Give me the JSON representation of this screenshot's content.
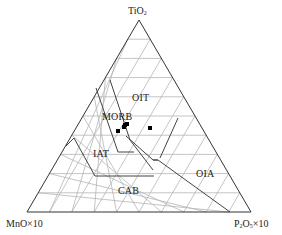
{
  "diagram": {
    "type": "ternary",
    "vertices": {
      "top": {
        "label": "TiO",
        "sub": "2"
      },
      "left": {
        "label": "MnO×10"
      },
      "right": {
        "label": "P",
        "sub1": "2",
        "mid": "O",
        "sub2": "5",
        "suffix": "×10"
      }
    },
    "grid_divisions": 10,
    "regions": [
      {
        "id": "oit",
        "label": "OIT"
      },
      {
        "id": "morb",
        "label": "MORB"
      },
      {
        "id": "iat",
        "label": "IAT"
      },
      {
        "id": "oia",
        "label": "OIA"
      },
      {
        "id": "cab",
        "label": "CAB"
      }
    ],
    "colors": {
      "frame": "#333333",
      "grid": "#b5b5b5",
      "boundary": "#444444",
      "points": "#000000"
    }
  },
  "chart_data": {
    "type": "scatter",
    "subtype": "ternary",
    "axes": [
      "TiO2",
      "MnO×10",
      "P2O5×10"
    ],
    "fields": [
      "OIT",
      "MORB",
      "IAT",
      "OIA",
      "CAB"
    ],
    "points": [
      {
        "TiO2": 0.55,
        "MnO×10": 0.36,
        "P2O5×10": 0.09
      },
      {
        "TiO2": 0.54,
        "MnO×10": 0.36,
        "P2O5×10": 0.1
      },
      {
        "TiO2": 0.53,
        "MnO×10": 0.37,
        "P2O5×10": 0.1
      },
      {
        "TiO2": 0.5,
        "MnO×10": 0.4,
        "P2O5×10": 0.1
      },
      {
        "TiO2": 0.52,
        "MnO×10": 0.29,
        "P2O5×10": 0.19
      }
    ],
    "grid": true,
    "legend": null
  }
}
